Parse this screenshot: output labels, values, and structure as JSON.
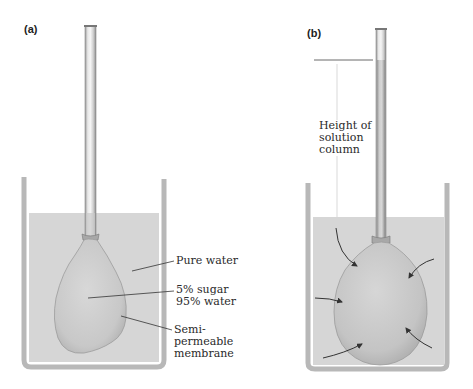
{
  "panels": [
    {
      "id": "a",
      "label": "(a)",
      "annotations": {
        "pure_water": "Pure water",
        "solution_line1": "5% sugar",
        "solution_line2": "95% water",
        "membrane_line1": "Semi-",
        "membrane_line2": "permeable",
        "membrane_line3": "membrane"
      }
    },
    {
      "id": "b",
      "label": "(b)",
      "annotations": {
        "height_line1": "Height of",
        "height_line2": "solution",
        "height_line3": "column"
      },
      "arrows": [
        "water-flow-arrow-top-left",
        "water-flow-arrow-right",
        "water-flow-arrow-left",
        "water-flow-arrow-bottom-left",
        "water-flow-arrow-bottom-right"
      ]
    }
  ],
  "colors": {
    "water": "#d6d6d6",
    "beaker_wall": "#b5b5b5",
    "balloon": "#c6c6c6",
    "leader_line": "#333333"
  }
}
